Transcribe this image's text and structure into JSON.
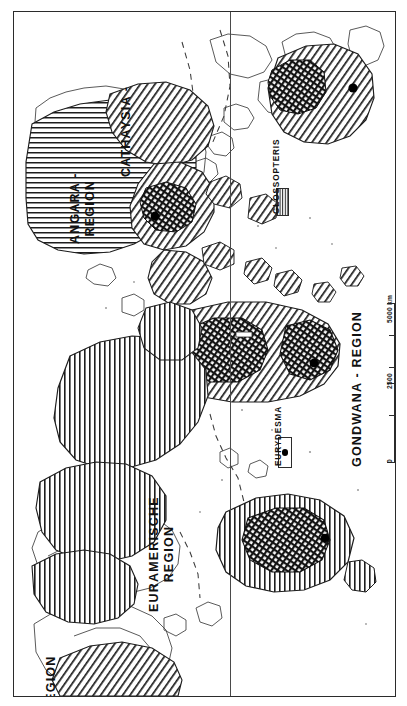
{
  "figure": {
    "kind": "paleogeographic-map",
    "orientation_note": "map is rotated 90 degrees; all labels read bottom-to-top",
    "background_color": "#ffffff",
    "line_color": "#2b2b2b"
  },
  "map": {
    "regions": [
      {
        "id": "angara",
        "label": "ANGARA -\nREGION",
        "pattern": "horizontal-lines"
      },
      {
        "id": "cathaysia",
        "label": "CATHAYSIA -",
        "pattern": "diagonal-lines"
      },
      {
        "id": "euramerische",
        "label": "EURAMERISCHE\nREGION",
        "pattern": "vertical-lines"
      },
      {
        "id": "gondwana",
        "label": "GONDWANA - REGION",
        "pattern": "diagonal-lines"
      },
      {
        "id": "region-cut",
        "label": "REGION",
        "pattern": "diagonal-lines"
      }
    ]
  },
  "legend": {
    "items": [
      {
        "id": "glossopteris",
        "label": "GLOSSOPTERIS",
        "symbol": "hatched-swatch"
      },
      {
        "id": "eurydesma",
        "label": "EURYDESMA",
        "symbol": "box-with-dot"
      }
    ]
  },
  "scale": {
    "unit_label": "5000 km",
    "ticks": [
      "0",
      "2500",
      "5000 km"
    ],
    "min": 0,
    "mid": 2500,
    "max": 5000
  }
}
